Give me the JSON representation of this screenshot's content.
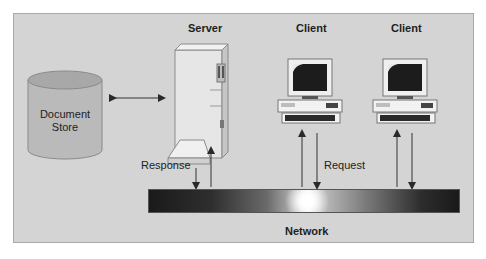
{
  "diagram": {
    "type": "client-server architecture",
    "nodes": {
      "document_store": {
        "label_line1": "Document",
        "label_line2": "Store",
        "shape": "cylinder"
      },
      "server": {
        "label": "Server",
        "icon": "server-tower-icon"
      },
      "client_1": {
        "label": "Client",
        "icon": "desktop-computer-icon"
      },
      "client_2": {
        "label": "Client",
        "icon": "desktop-computer-icon"
      },
      "network": {
        "label": "Network",
        "shape": "gradient-bar"
      }
    },
    "edges": [
      {
        "from": "document_store",
        "to": "server",
        "direction": "bidirectional"
      },
      {
        "from": "server",
        "to": "network",
        "direction": "down",
        "label": "Response"
      },
      {
        "from": "network",
        "to": "server",
        "direction": "up"
      },
      {
        "from": "client_1",
        "to": "network",
        "direction": "down",
        "label": "Request"
      },
      {
        "from": "network",
        "to": "client_1",
        "direction": "up"
      },
      {
        "from": "client_2",
        "to": "network",
        "direction": "down"
      },
      {
        "from": "network",
        "to": "client_2",
        "direction": "up"
      }
    ],
    "labels": {
      "response": "Response",
      "request": "Request"
    },
    "colors": {
      "background": "#d4d4d4",
      "frame_border": "#a9a9a9",
      "cylinder_fill": "#b8b8b8",
      "arrow": "#333333"
    }
  }
}
